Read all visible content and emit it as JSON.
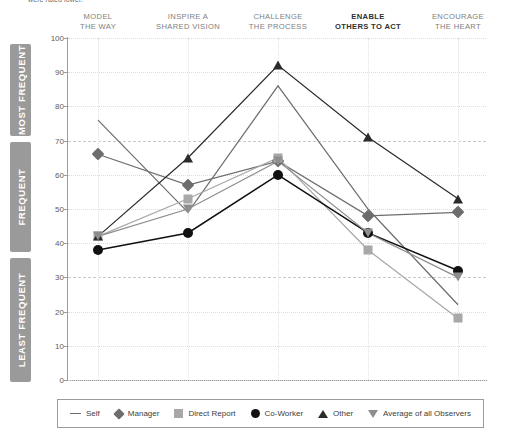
{
  "top_note": "were rated lower.",
  "bands": [
    {
      "id": "most",
      "label": "MOST FREQUENT"
    },
    {
      "id": "freq",
      "label": "FREQUENT"
    },
    {
      "id": "least",
      "label": "LEAST FREQUENT"
    }
  ],
  "legend": {
    "items": [
      {
        "icon": "line-glyph",
        "label": "Self"
      },
      {
        "icon": "diamond-glyph",
        "label": "Manager"
      },
      {
        "icon": "square-glyph",
        "label": "Direct Report"
      },
      {
        "icon": "circle-glyph",
        "label": "Co-Worker"
      },
      {
        "icon": "triangle-up-glyph",
        "label": "Other"
      },
      {
        "icon": "triangle-down-glyph",
        "label": "Average of all Observers"
      }
    ]
  },
  "chart_data": {
    "type": "line",
    "title": "",
    "xlabel": "",
    "ylabel": "",
    "ylim": [
      0,
      100
    ],
    "yticks": [
      0,
      10,
      20,
      30,
      40,
      50,
      60,
      70,
      80,
      90,
      100
    ],
    "grid": true,
    "legend_position": "bottom",
    "emphasis_gridlines": [
      30,
      70
    ],
    "categories": [
      "MODEL\nTHE WAY",
      "INSPIRE A\nSHARED VISION",
      "CHALLENGE\nTHE PROCESS",
      "ENABLE\nOTHERS TO ACT",
      "ENCOURAGE\nTHE HEART"
    ],
    "highlighted_category": "ENABLE\nOTHERS TO ACT",
    "series": [
      {
        "name": "Self",
        "marker": "none",
        "color": "#6d6d6d",
        "values": [
          76,
          49,
          86,
          50,
          22
        ]
      },
      {
        "name": "Manager",
        "marker": "diamond",
        "color": "#6d6d6d",
        "values": [
          66,
          57,
          64,
          48,
          49
        ]
      },
      {
        "name": "Direct Report",
        "marker": "square",
        "color": "#a8a8a8",
        "values": [
          42,
          53,
          65,
          38,
          18
        ]
      },
      {
        "name": "Co-Worker",
        "marker": "circle",
        "color": "#111111",
        "values": [
          38,
          43,
          60,
          43,
          32
        ]
      },
      {
        "name": "Other",
        "marker": "triangle-up",
        "color": "#2b2b2b",
        "values": [
          42,
          65,
          92,
          71,
          53
        ]
      },
      {
        "name": "Average of all Observers",
        "marker": "triangle-down",
        "color": "#8d8d8d",
        "values": [
          42,
          50,
          64,
          43,
          30
        ]
      }
    ]
  }
}
